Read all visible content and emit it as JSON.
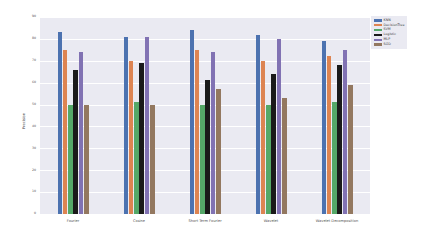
{
  "chart_data": {
    "type": "bar",
    "title": "",
    "xlabel": "",
    "ylabel": "Precision",
    "ylim": [
      0,
      90
    ],
    "yticks": [
      0,
      10,
      20,
      30,
      40,
      50,
      60,
      70,
      80,
      90
    ],
    "grid": true,
    "legend_position": "upper right",
    "categories": [
      "Fourier",
      "Cosine",
      "Short Term Fourier",
      "Wavelet",
      "Wavelet Decomposition"
    ],
    "series": [
      {
        "name": "KNN",
        "color": "#4c72b0",
        "values": [
          83,
          81,
          84,
          82,
          79
        ]
      },
      {
        "name": "DecisionTree",
        "color": "#dd8452",
        "values": [
          75,
          70,
          75,
          70,
          72
        ]
      },
      {
        "name": "SVM",
        "color": "#55a868",
        "values": [
          50,
          51,
          50,
          50,
          51
        ]
      },
      {
        "name": "Logistic",
        "color": "#1a1a1a",
        "values": [
          66,
          69,
          61,
          64,
          68
        ]
      },
      {
        "name": "MLP",
        "color": "#8172b3",
        "values": [
          74,
          81,
          74,
          80,
          75
        ]
      },
      {
        "name": "SGD",
        "color": "#937860",
        "values": [
          50,
          50,
          57,
          53,
          59
        ]
      }
    ]
  },
  "legend": {
    "items": [
      {
        "label": "KNN"
      },
      {
        "label": "DecisionTree"
      },
      {
        "label": "SVM"
      },
      {
        "label": "Logistic"
      },
      {
        "label": "MLP"
      },
      {
        "label": "SGD"
      }
    ]
  }
}
